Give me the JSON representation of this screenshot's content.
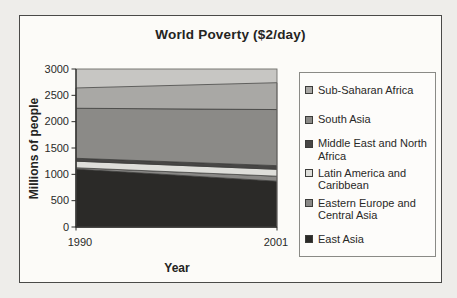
{
  "page": {
    "background": "#eeedea"
  },
  "figure": {
    "border_color": "#4a4a48",
    "background": "#fcfbf8"
  },
  "chart_data": {
    "type": "area",
    "stacked": true,
    "title": "World Poverty ($2/day)",
    "xlabel": "Year",
    "ylabel": "Millions of people",
    "x": [
      1990,
      2001
    ],
    "x_tick_labels": [
      "1990",
      "2001"
    ],
    "ylim": [
      0,
      3000
    ],
    "yticks": [
      0,
      500,
      1000,
      1500,
      2000,
      2500,
      3000
    ],
    "grid": false,
    "legend_position": "right",
    "plot_background": "#c7c6c3",
    "series_outline": "#3a3a38",
    "stack_order_note": "series listed top-of-stack first (legend order); stacked bottom-to-top in reverse",
    "series": [
      {
        "name": "Sub-Saharan Africa",
        "legend_label": "Sub-Saharan Africa",
        "color": "#a9a8a5",
        "values": [
          385,
          510
        ]
      },
      {
        "name": "South Asia",
        "legend_label": "South Asia",
        "color": "#8b8a87",
        "values": [
          950,
          1065
        ]
      },
      {
        "name": "Middle East and North Africa",
        "legend_label": "Middle East and North\nAfrica",
        "color": "#474645",
        "values": [
          55,
          70
        ]
      },
      {
        "name": "Latin America and Caribbean",
        "legend_label": "Latin America and\nCaribbean",
        "color": "#dededa",
        "values": [
          125,
          130
        ]
      },
      {
        "name": "Eastern Europe and Central Asia",
        "legend_label": "Eastern Europe and\nCentral Asia",
        "color": "#898886",
        "values": [
          25,
          95
        ]
      },
      {
        "name": "East Asia",
        "legend_label": "East Asia",
        "color": "#2b2a28",
        "values": [
          1100,
          870
        ]
      }
    ],
    "totals": {
      "1990": 2640,
      "2001": 2740
    }
  }
}
